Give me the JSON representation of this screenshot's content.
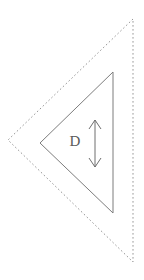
{
  "diagram": {
    "background_color": "#ffffff",
    "outer_shape": {
      "name": "dashed-triangle",
      "style": "dashed",
      "stroke_color": "#8a8a8a",
      "stroke_width": 0.9,
      "dash_pattern": "1.6 2.4",
      "vertices": [
        [
          133,
          19
        ],
        [
          8,
          140
        ],
        [
          133,
          262
        ]
      ]
    },
    "inner_shape": {
      "name": "solid-triangle",
      "style": "solid",
      "stroke_color": "#7d7d7d",
      "stroke_width": 1.0,
      "vertices": [
        [
          113,
          72
        ],
        [
          40,
          143
        ],
        [
          113,
          213
        ]
      ]
    },
    "dimension": {
      "name": "vertical-double-arrow",
      "label": "D",
      "stroke_color": "#6e6e6e",
      "stroke_width": 1.0,
      "x": 95,
      "y_top": 120,
      "y_bottom": 167,
      "arrowhead_half_width": 6,
      "arrowhead_length": 9
    }
  }
}
